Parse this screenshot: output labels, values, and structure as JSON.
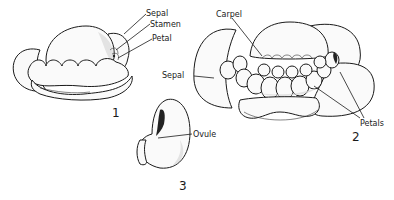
{
  "figures": [
    {
      "number": "1",
      "subject": "flower bud",
      "labels": [
        "Sepal",
        "Stamen",
        "Petal"
      ]
    },
    {
      "number": "2",
      "subject": "open flower",
      "labels": [
        "Carpel",
        "Sepal",
        "Petals"
      ]
    },
    {
      "number": "3",
      "subject": "carpel",
      "labels": [
        "Ovule"
      ]
    }
  ],
  "colors": {
    "ink": "#1a1a1a",
    "background": "#ffffff"
  }
}
